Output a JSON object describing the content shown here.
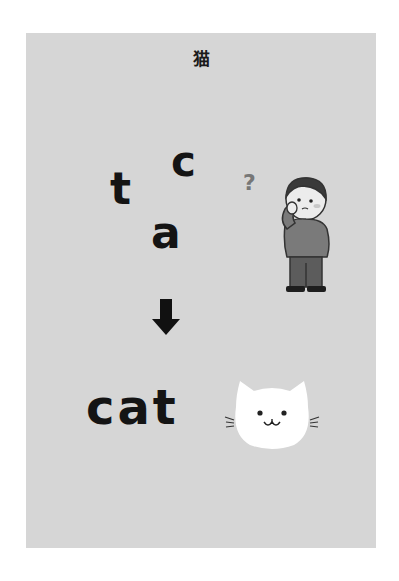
{
  "card": {
    "title": "猫",
    "scrambled_letters": [
      {
        "char": "t",
        "role": "scrambled-letter"
      },
      {
        "char": "c",
        "role": "scrambled-letter"
      },
      {
        "char": "a",
        "role": "scrambled-letter"
      }
    ],
    "question_mark": "?",
    "answer_word": "cat",
    "icons": {
      "person": "thinking-person-icon",
      "arrow": "arrow-down-icon",
      "cat": "cat-face-icon"
    },
    "colors": {
      "card_background": "#d6d6d6",
      "text": "#141414",
      "cat_face": "#ffffff",
      "question_mark": "#777777"
    }
  }
}
